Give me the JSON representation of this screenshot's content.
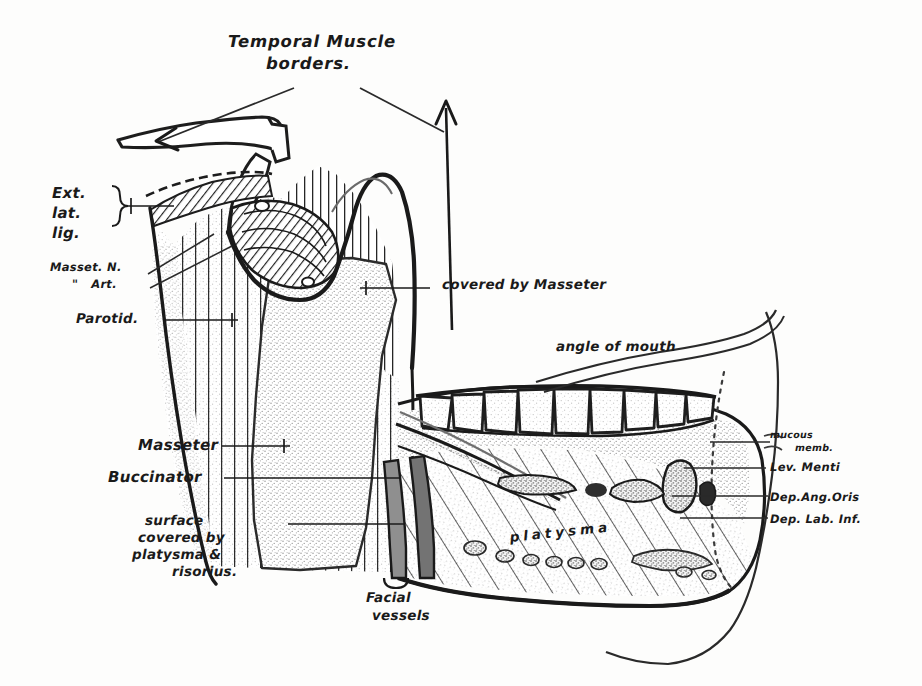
{
  "figure": {
    "kind": "anatomical-line-drawing",
    "ink_color": "#1a1a1a",
    "paper_color": "#fdfdfc",
    "stipple_color": "#bdbdbd",
    "vessel_color": "#8d8d8d"
  },
  "title": {
    "line1": "Temporal Muscle",
    "line2": "borders."
  },
  "labels": {
    "ext_lat_lig": {
      "line1": "Ext.",
      "line2": "lat.",
      "line3": "lig."
    },
    "masset_n": "Masset. N.",
    "masset_art": "\"   Art.",
    "parotid": "Parotid.",
    "covered_by_masseter": "covered by Masseter",
    "angle_of_mouth": "angle of mouth",
    "masseter": "Masseter",
    "buccinator": "Buccinator",
    "surface_covered": {
      "line1": "surface",
      "line2": "covered by",
      "line3": "platysma &",
      "line4": "risorius."
    },
    "facial_vessels": {
      "line1": "Facial",
      "line2": "vessels"
    },
    "platysma": "platysma",
    "mucous_memb": {
      "line1": "mucous",
      "line2": "memb."
    },
    "lev_menti": "Lev. Menti",
    "dep_ang_oris": "Dep.Ang.Oris",
    "dep_lab_inf": "Dep. Lab. Inf."
  }
}
